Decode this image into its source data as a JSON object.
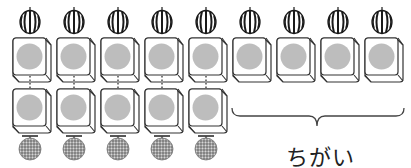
{
  "diagram": {
    "top_row": {
      "item": "watermelon",
      "count": 9
    },
    "bottom_row": {
      "item": "melon",
      "count": 5
    },
    "difference_label": "ちがい",
    "colors": {
      "box_stroke": "#333333",
      "circle_fill": "#bdbdbd",
      "watermelon_stripe": "#1a1a1a",
      "melon_fill": "#9a9a9a"
    }
  }
}
